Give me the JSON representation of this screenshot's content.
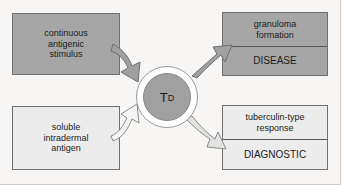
{
  "diagram": {
    "center": {
      "label_main": "T",
      "label_sub": "D"
    },
    "inputs": [
      {
        "id": "continuous-antigenic-stimulus",
        "lines": [
          "continuous",
          "antigenic",
          "stimulus"
        ],
        "fill": "#a6a6a6"
      },
      {
        "id": "soluble-intradermal-antigen",
        "lines": [
          "soluble",
          "intradermal",
          "antigen"
        ],
        "fill": "#ececec"
      }
    ],
    "outputs": [
      {
        "id": "granuloma-disease",
        "response_lines": [
          "granuloma",
          "formation"
        ],
        "outcome": "DISEASE",
        "fill": "#a6a6a6"
      },
      {
        "id": "tuberculin-diagnostic",
        "response_lines": [
          "tuberculin-type",
          "response"
        ],
        "outcome": "DIAGNOSTIC",
        "fill": "#ececec"
      }
    ],
    "arrows": [
      {
        "id": "arrow-stimulus-to-td",
        "style": "filled-gray",
        "fill": "#a0a0a0",
        "stroke": "#6f6f6f"
      },
      {
        "id": "arrow-td-to-disease",
        "style": "filled-gray",
        "fill": "#a0a0a0",
        "stroke": "#6f6f6f"
      },
      {
        "id": "arrow-antigen-to-td",
        "style": "hollow-white",
        "fill": "#f4f4f2",
        "stroke": "#8a8a8a"
      },
      {
        "id": "arrow-td-to-diagnostic",
        "style": "hollow-white",
        "fill": "#e2e2e0",
        "stroke": "#8a8a8a"
      }
    ],
    "colors": {
      "background": "#f7f6f4",
      "box_border": "#6f6f6f",
      "fill_dark": "#a6a6a6",
      "fill_light": "#ececec",
      "text": "#1b1b1b"
    }
  }
}
